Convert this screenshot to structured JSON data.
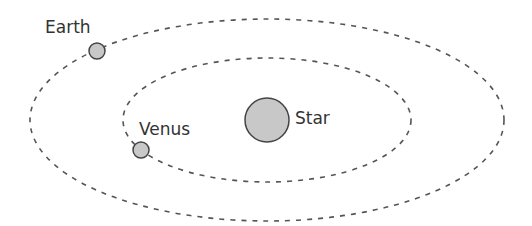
{
  "diagram": {
    "title": "",
    "labels": {
      "earth": "Earth",
      "venus": "Venus",
      "star": "Star"
    },
    "colors": {
      "orbit": "#555555",
      "body_fill": "#c8c8c8",
      "body_stroke": "#444444",
      "text": "#333333"
    }
  }
}
